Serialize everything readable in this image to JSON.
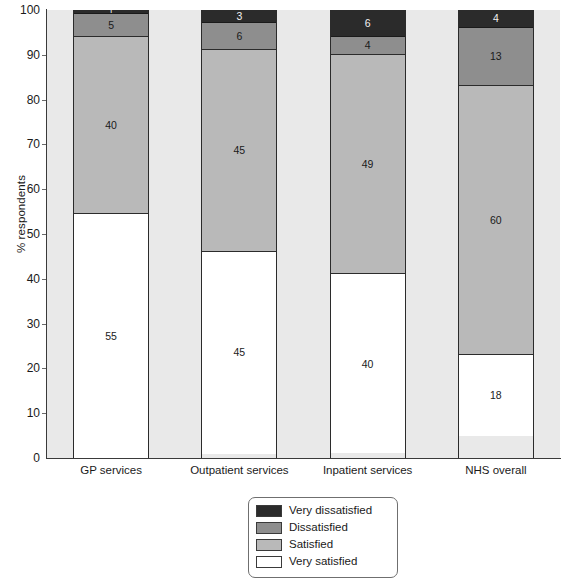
{
  "chart_data": {
    "type": "bar",
    "subtype": "stacked-bar-100",
    "title": "",
    "xlabel": "",
    "ylabel": "% respondents",
    "ylim": [
      0,
      100
    ],
    "ytick_step": 10,
    "yticks": [
      0,
      10,
      20,
      30,
      40,
      50,
      60,
      70,
      80,
      90,
      100
    ],
    "ytick_labels": [
      "0",
      "10",
      "20",
      "30",
      "40",
      "50",
      "60",
      "70",
      "80",
      "90",
      "100"
    ],
    "grid": false,
    "legend_position": "bottom-center",
    "categories": [
      "GP services",
      "Outpatient services",
      "Inpatient services",
      "NHS overall"
    ],
    "stack_order_bottom_to_top": [
      "Very satisfied",
      "Satisfied",
      "Dissatisfied",
      "Very dissatisfied"
    ],
    "series": [
      {
        "name": "Very satisfied",
        "color": "#ffffff",
        "values": [
          55,
          45,
          40,
          18
        ],
        "labels": [
          "55",
          "45",
          "40",
          "18"
        ]
      },
      {
        "name": "Satisfied",
        "color": "#b9b9b9",
        "values": [
          40,
          45,
          49,
          60
        ],
        "labels": [
          "40",
          "45",
          "49",
          "60"
        ]
      },
      {
        "name": "Dissatisfied",
        "color": "#8e8e8e",
        "values": [
          5,
          6,
          4,
          13
        ],
        "labels": [
          "5",
          "6",
          "4",
          "13"
        ]
      },
      {
        "name": "Very dissatisfied",
        "color": "#2b2b2b",
        "values": [
          1,
          3,
          6,
          4
        ],
        "labels": [
          "1",
          "3",
          "6",
          "4"
        ]
      }
    ]
  },
  "axis": {
    "y_title": "% respondents"
  },
  "legend": {
    "items": [
      {
        "label": "Very dissatisfied",
        "color": "#2b2b2b"
      },
      {
        "label": "Dissatisfied",
        "color": "#8e8e8e"
      },
      {
        "label": "Satisfied",
        "color": "#b9b9b9"
      },
      {
        "label": "Very satisfied",
        "color": "#ffffff"
      }
    ]
  },
  "colors": {
    "plot_background": "#e9e9e9",
    "axis": "#3a3a3a",
    "bar_outline": "#2b2b2b",
    "page_background": "#ffffff"
  }
}
